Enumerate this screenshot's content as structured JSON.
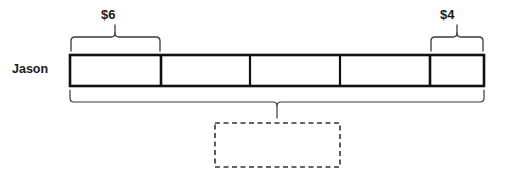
{
  "diagram": {
    "type": "tape-diagram",
    "row_label": "Jason",
    "bar": {
      "x": 70,
      "y": 55,
      "width": 414,
      "height": 31,
      "stroke_color": "#111111",
      "fill_color": "#ffffff",
      "segment_count": 5,
      "divider_positions": [
        161,
        250,
        340,
        430
      ],
      "segments": [
        {
          "index": 1,
          "x": 70,
          "width": 91,
          "label": "$6"
        },
        {
          "index": 2,
          "x": 161,
          "width": 89,
          "label": ""
        },
        {
          "index": 3,
          "x": 250,
          "width": 90,
          "label": ""
        },
        {
          "index": 4,
          "x": 340,
          "width": 90,
          "label": ""
        },
        {
          "index": 5,
          "x": 430,
          "width": 54,
          "label": "$4"
        }
      ]
    },
    "braces": [
      {
        "name": "brace-six",
        "orientation": "up",
        "x_start": 71,
        "x_end": 160,
        "y_base": 51,
        "label": "$6",
        "label_x": 101,
        "label_y": 8
      },
      {
        "name": "brace-four",
        "orientation": "up",
        "x_start": 431,
        "x_end": 483,
        "y_base": 51,
        "label": "$4",
        "label_x": 440,
        "label_y": 8
      },
      {
        "name": "brace-total",
        "orientation": "down",
        "x_start": 70,
        "x_end": 484,
        "y_base": 90,
        "label": "",
        "label_x": 277,
        "label_y": 120
      }
    ],
    "answer_box": {
      "name": "answer-box",
      "x": 215,
      "y": 123,
      "width": 125,
      "height": 44,
      "value": "",
      "style": "dashed",
      "stroke_color": "#333333"
    },
    "colors": {
      "ink": "#111111",
      "thin_ink": "#3a3a3a",
      "paper": "#ffffff"
    }
  }
}
